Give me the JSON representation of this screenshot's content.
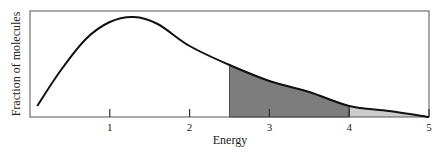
{
  "chart_data": {
    "type": "line",
    "title": "",
    "xlabel": "Energy",
    "ylabel": "Fraction of molecules",
    "xlim": [
      0,
      5
    ],
    "ylim": [
      0,
      1
    ],
    "grid": false,
    "legend": null,
    "x_ticks": [
      1,
      2,
      3,
      4,
      5
    ],
    "x_tick_labels": [
      "1",
      "2",
      "3",
      "4",
      "5"
    ],
    "y_ticks": [],
    "series": [
      {
        "name": "distribution",
        "x": [
          0.09,
          0.38,
          0.7,
          1.0,
          1.3,
          1.6,
          2.0,
          2.5,
          3.0,
          3.5,
          4.0,
          4.5,
          5.0
        ],
        "y": [
          0.11,
          0.46,
          0.78,
          0.95,
          1.0,
          0.93,
          0.71,
          0.52,
          0.36,
          0.25,
          0.11,
          0.06,
          0.0
        ]
      }
    ],
    "shaded_regions": [
      {
        "from": 2.5,
        "to": 4.0,
        "color": "#7d7d7d",
        "label": "dark shaded region"
      },
      {
        "from": 4.0,
        "to": 5.0,
        "color": "#cccccc",
        "label": "light shaded region"
      }
    ],
    "curve_color": "#111111",
    "frame_color": "#555555"
  }
}
